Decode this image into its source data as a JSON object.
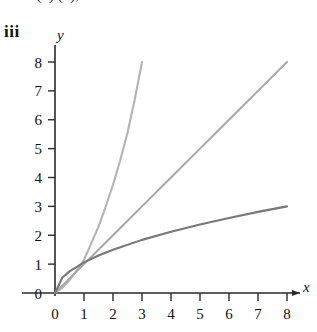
{
  "header": {
    "clipped_formula": "n 1   (n)     (n), 0 2 n   00",
    "panel_label": "iii"
  },
  "chart_data": {
    "type": "line",
    "title": "",
    "xlabel": "x",
    "ylabel": "y",
    "xlim": [
      0,
      8
    ],
    "ylim": [
      0,
      8
    ],
    "grid": false,
    "legend": "none",
    "xticks": [
      0,
      1,
      2,
      3,
      4,
      5,
      6,
      7,
      8
    ],
    "yticks": [
      0,
      1,
      2,
      3,
      4,
      5,
      6,
      7,
      8
    ],
    "xticklabels": [
      "0",
      "1",
      "2",
      "3",
      "4",
      "5",
      "6",
      "7",
      "8"
    ],
    "yticklabels": [
      "0",
      "1",
      "2",
      "3",
      "4",
      "5",
      "6",
      "7",
      "8"
    ],
    "series": [
      {
        "name": "steep-convex-curve",
        "color": "#b4b4b4",
        "x": [
          0,
          0.25,
          0.5,
          0.75,
          1,
          1.25,
          1.5,
          1.75,
          2,
          2.25,
          2.5,
          2.75,
          3
        ],
        "values": [
          0,
          0.18,
          0.45,
          0.78,
          1.15,
          1.72,
          2.3,
          3.0,
          3.75,
          4.6,
          5.55,
          6.7,
          8.0
        ]
      },
      {
        "name": "straight-line",
        "color": "#a8a8a8",
        "x": [
          0,
          1,
          2,
          3,
          4,
          5,
          6,
          7,
          8
        ],
        "values": [
          0,
          1,
          2,
          3,
          4,
          5,
          6,
          7,
          8
        ]
      },
      {
        "name": "concave-root-curve",
        "color": "#787878",
        "x": [
          0,
          0.25,
          0.5,
          1,
          1.5,
          2,
          3,
          4,
          5,
          6,
          7,
          8
        ],
        "values": [
          0,
          0.53,
          0.75,
          1.06,
          1.3,
          1.5,
          1.84,
          2.12,
          2.37,
          2.6,
          2.81,
          3.0
        ]
      }
    ]
  },
  "colors": {
    "axis": "#2a2a2a",
    "curve_light": "#b4b4b4",
    "curve_mid": "#a8a8a8",
    "curve_dark": "#787878"
  }
}
